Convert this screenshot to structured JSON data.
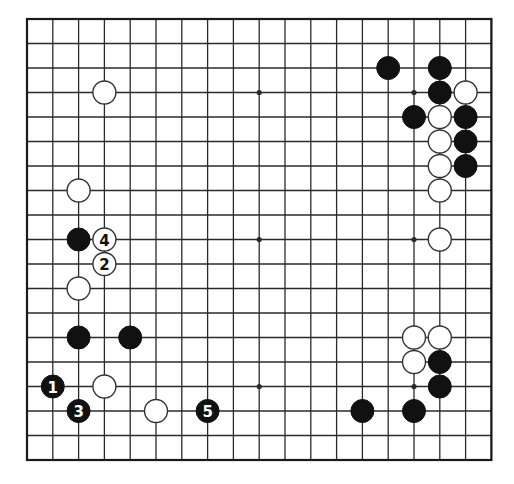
{
  "diagram": {
    "board_size": 19,
    "geometry": {
      "origin_x": 27,
      "origin_y": 19,
      "spacing_x": 25.8,
      "spacing_y": 24.5,
      "stone_radius": 11.5
    },
    "colors": {
      "line": "#2a2a2a",
      "border": "#1a1a1a",
      "black_stone": "#111111",
      "white_stone": "#ffffff",
      "white_outline": "#333333",
      "label_on_black": "#ffffff",
      "label_on_white": "#111111"
    },
    "star_points": [
      [
        3,
        3
      ],
      [
        9,
        3
      ],
      [
        15,
        3
      ],
      [
        3,
        9
      ],
      [
        9,
        9
      ],
      [
        15,
        9
      ],
      [
        3,
        15
      ],
      [
        9,
        15
      ],
      [
        15,
        15
      ]
    ],
    "stones": [
      {
        "color": "white",
        "col": 3,
        "row": 3,
        "label": ""
      },
      {
        "color": "white",
        "col": 2,
        "row": 7,
        "label": ""
      },
      {
        "color": "black",
        "col": 2,
        "row": 9,
        "label": ""
      },
      {
        "color": "white",
        "col": 3,
        "row": 9,
        "label": "4"
      },
      {
        "color": "white",
        "col": 3,
        "row": 10,
        "label": "2"
      },
      {
        "color": "white",
        "col": 2,
        "row": 11,
        "label": ""
      },
      {
        "color": "black",
        "col": 2,
        "row": 13,
        "label": ""
      },
      {
        "color": "black",
        "col": 4,
        "row": 13,
        "label": ""
      },
      {
        "color": "black",
        "col": 1,
        "row": 15,
        "label": "1"
      },
      {
        "color": "white",
        "col": 3,
        "row": 15,
        "label": ""
      },
      {
        "color": "black",
        "col": 2,
        "row": 16,
        "label": "3"
      },
      {
        "color": "white",
        "col": 5,
        "row": 16,
        "label": ""
      },
      {
        "color": "black",
        "col": 7,
        "row": 16,
        "label": "5"
      },
      {
        "color": "black",
        "col": 14,
        "row": 2,
        "label": ""
      },
      {
        "color": "black",
        "col": 16,
        "row": 2,
        "label": ""
      },
      {
        "color": "black",
        "col": 16,
        "row": 3,
        "label": ""
      },
      {
        "color": "white",
        "col": 17,
        "row": 3,
        "label": ""
      },
      {
        "color": "black",
        "col": 15,
        "row": 4,
        "label": ""
      },
      {
        "color": "white",
        "col": 16,
        "row": 4,
        "label": ""
      },
      {
        "color": "black",
        "col": 17,
        "row": 4,
        "label": ""
      },
      {
        "color": "white",
        "col": 16,
        "row": 5,
        "label": ""
      },
      {
        "color": "black",
        "col": 17,
        "row": 5,
        "label": ""
      },
      {
        "color": "white",
        "col": 16,
        "row": 6,
        "label": ""
      },
      {
        "color": "black",
        "col": 17,
        "row": 6,
        "label": ""
      },
      {
        "color": "white",
        "col": 16,
        "row": 7,
        "label": ""
      },
      {
        "color": "white",
        "col": 16,
        "row": 9,
        "label": ""
      },
      {
        "color": "white",
        "col": 15,
        "row": 13,
        "label": ""
      },
      {
        "color": "white",
        "col": 16,
        "row": 13,
        "label": ""
      },
      {
        "color": "white",
        "col": 15,
        "row": 14,
        "label": ""
      },
      {
        "color": "black",
        "col": 16,
        "row": 14,
        "label": ""
      },
      {
        "color": "black",
        "col": 16,
        "row": 15,
        "label": ""
      },
      {
        "color": "black",
        "col": 13,
        "row": 16,
        "label": ""
      },
      {
        "color": "black",
        "col": 15,
        "row": 16,
        "label": ""
      }
    ]
  }
}
